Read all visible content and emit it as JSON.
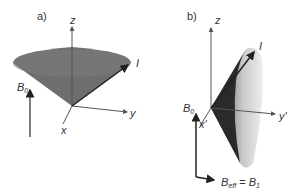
{
  "panels": [
    {
      "id": "a",
      "label": "a)",
      "axes": {
        "z": "z",
        "y": "y",
        "x": "x"
      },
      "vector_label": "I",
      "field": {
        "main": "B",
        "sub": "0"
      }
    },
    {
      "id": "b",
      "label": "b)",
      "axes": {
        "z": "z",
        "y": "y'",
        "x": "x'"
      },
      "vector_label": "I",
      "field": {
        "main": "B",
        "sub": "0"
      },
      "effective_field": {
        "main": "B",
        "sub": "eff",
        "eq": " = ",
        "main2": "B",
        "sub2": "1"
      }
    }
  ],
  "colors": {
    "cone_a": "#6e6e6e",
    "cone_a_top": "#7c7c7c",
    "cone_b_dark": "#2a2a2a",
    "cone_b_light": "#d8d8d8",
    "axis": "#555555",
    "arrow": "#222222"
  }
}
